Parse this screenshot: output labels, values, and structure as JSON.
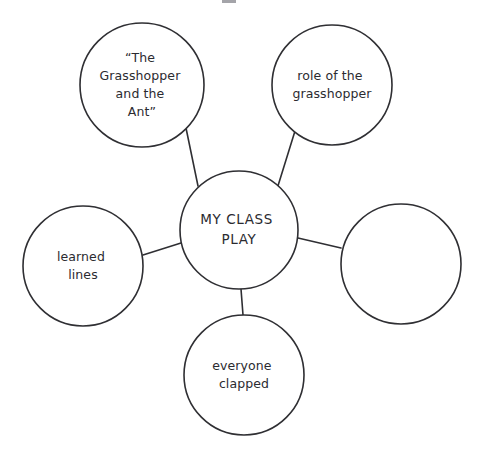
{
  "diagram": {
    "type": "cluster-web-graphic-organizer",
    "style": "hand-drawn",
    "stroke_color": "#2f2f33",
    "text_color": "#2b2b30",
    "background_color": "#ffffff",
    "central_node": {
      "id": "my-class-play",
      "label": "MY CLASS PLAY",
      "lines": [
        "MY CLASS",
        "PLAY"
      ],
      "cx": 239,
      "cy": 230,
      "r": 59,
      "empty": false
    },
    "satellite_nodes": [
      {
        "id": "grasshopper-and-the-ant",
        "label": "“The Grasshopper and the Ant”",
        "lines": [
          "“The",
          "Grasshopper",
          "and the",
          "Ant”"
        ],
        "position": "top-left",
        "cx": 142,
        "cy": 85,
        "r": 62,
        "empty": false
      },
      {
        "id": "role-of-the-grasshopper",
        "label": "role of the grasshopper",
        "lines": [
          "role of the",
          "grasshopper"
        ],
        "position": "top-right",
        "cx": 332,
        "cy": 85,
        "r": 60,
        "empty": false
      },
      {
        "id": "blank-node",
        "label": "",
        "lines": [],
        "position": "right",
        "cx": 401,
        "cy": 264,
        "r": 60,
        "empty": true
      },
      {
        "id": "everyone-clapped",
        "label": "everyone clapped",
        "lines": [
          "everyone",
          "clapped"
        ],
        "position": "bottom",
        "cx": 244,
        "cy": 375,
        "r": 60,
        "empty": false
      },
      {
        "id": "learned-lines",
        "label": "learned lines",
        "lines": [
          "learned",
          "lines"
        ],
        "position": "left",
        "cx": 83,
        "cy": 266,
        "r": 60,
        "empty": false
      }
    ],
    "connectors": [
      {
        "id": "connector-to-grasshopper-and-the-ant",
        "x1": 186,
        "y1": 128,
        "x2": 198,
        "y2": 186
      },
      {
        "id": "connector-to-role-of-the-grasshopper",
        "x1": 295,
        "y1": 131,
        "x2": 277,
        "y2": 189
      },
      {
        "id": "connector-to-blank-node",
        "x1": 298,
        "y1": 238,
        "x2": 341,
        "y2": 248
      },
      {
        "id": "connector-to-everyone-clapped",
        "x1": 241,
        "y1": 289,
        "x2": 243,
        "y2": 315
      },
      {
        "id": "connector-to-learned-lines",
        "x1": 181,
        "y1": 243,
        "x2": 143,
        "y2": 255
      }
    ]
  }
}
